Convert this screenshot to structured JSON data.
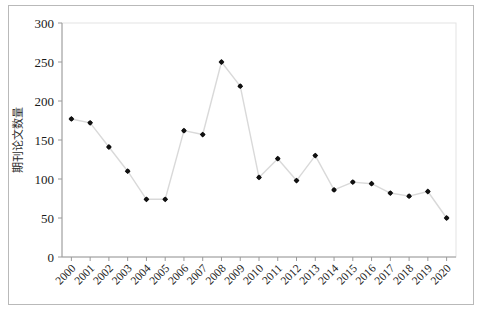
{
  "chart_data": {
    "type": "line",
    "title": "",
    "xlabel": "",
    "ylabel": "期刊论文数量",
    "categories": [
      "2000",
      "2001",
      "2002",
      "2003",
      "2004",
      "2005",
      "2006",
      "2007",
      "2008",
      "2009",
      "2010",
      "2011",
      "2012",
      "2013",
      "2014",
      "2015",
      "2016",
      "2017",
      "2018",
      "2019",
      "2020"
    ],
    "values": [
      177,
      172,
      141,
      110,
      74,
      74,
      162,
      157,
      250,
      219,
      102,
      126,
      98,
      130,
      86,
      96,
      94,
      82,
      78,
      84,
      50
    ],
    "series": [
      {
        "name": "期刊论文数量",
        "values": [
          177,
          172,
          141,
          110,
          74,
          74,
          162,
          157,
          250,
          219,
          102,
          126,
          98,
          130,
          86,
          96,
          94,
          82,
          78,
          84,
          50
        ]
      }
    ],
    "ylim": [
      0,
      300
    ],
    "yticks": [
      0,
      50,
      100,
      150,
      200,
      250,
      300
    ],
    "ytick_labels": [
      "0",
      "50",
      "100",
      "150",
      "200",
      "250",
      "300"
    ],
    "xtick_rotation": 45,
    "grid": false,
    "legend": false,
    "marker": "diamond",
    "marker_color": "#111111",
    "line_color": "#d9d9d9",
    "frame_color": "#b9b9b9",
    "axis_color": "#9a9a9a"
  }
}
